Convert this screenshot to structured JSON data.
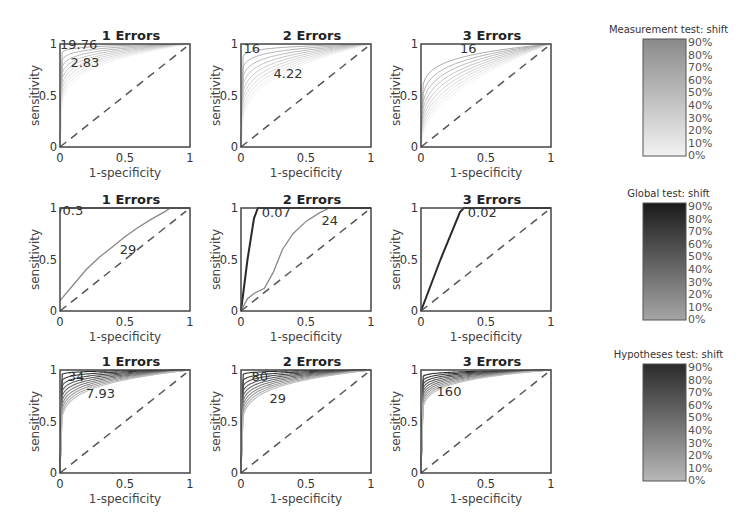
{
  "chart_data": [
    {
      "type": "line",
      "row": 0,
      "col": 0,
      "title": "1 Errors",
      "xlabel": "1-specificity",
      "ylabel": "sensitivity",
      "xlim": [
        0,
        1
      ],
      "ylim": [
        0,
        1
      ],
      "xticks": [
        "0",
        "0.5",
        "1"
      ],
      "yticks": [
        "0",
        "0.5",
        "1"
      ],
      "annotations": [
        {
          "text": "19.76",
          "x": 0.0,
          "y": 1.0
        },
        {
          "text": "2.83",
          "x": 0.08,
          "y": 0.83
        }
      ],
      "shade": "light",
      "curve_params": [
        0.02,
        0.04,
        0.06,
        0.08,
        0.1,
        0.12,
        0.14,
        0.16,
        0.18,
        0.2
      ],
      "diagonal": true
    },
    {
      "type": "line",
      "row": 0,
      "col": 1,
      "title": "2 Errors",
      "xlabel": "1-specificity",
      "ylabel": "sensitivity",
      "xlim": [
        0,
        1
      ],
      "ylim": [
        0,
        1
      ],
      "xticks": [
        "0",
        "0.5",
        "1"
      ],
      "yticks": [
        "0",
        "0.5",
        "1"
      ],
      "annotations": [
        {
          "text": "16",
          "x": 0.02,
          "y": 0.96
        },
        {
          "text": "4.22",
          "x": 0.25,
          "y": 0.72
        }
      ],
      "shade": "light",
      "curve_params": [
        0.03,
        0.06,
        0.09,
        0.12,
        0.15,
        0.18,
        0.21,
        0.24,
        0.27,
        0.3
      ],
      "diagonal": true
    },
    {
      "type": "line",
      "row": 0,
      "col": 2,
      "title": "3 Errors",
      "xlabel": "1-specificity",
      "ylabel": "sensitivity",
      "xlim": [
        0,
        1
      ],
      "ylim": [
        0,
        1
      ],
      "xticks": [
        "0",
        "0.5",
        "1"
      ],
      "yticks": [
        "0",
        "0.5",
        "1"
      ],
      "annotations": [
        {
          "text": "16",
          "x": 0.3,
          "y": 0.96
        }
      ],
      "shade": "light",
      "curve_params": [
        0.12,
        0.16,
        0.2,
        0.24,
        0.28,
        0.32,
        0.36,
        0.4,
        0.44,
        0.48
      ],
      "diagonal": true
    },
    {
      "type": "line",
      "row": 1,
      "col": 0,
      "title": "1 Errors",
      "xlabel": "1-specificity",
      "ylabel": "sensitivity",
      "xlim": [
        0,
        1
      ],
      "ylim": [
        0,
        1
      ],
      "xticks": [
        "0",
        "0.5",
        "1"
      ],
      "yticks": [
        "0",
        "0.5",
        "1"
      ],
      "annotations": [
        {
          "text": "0.3",
          "x": 0.02,
          "y": 0.98
        },
        {
          "text": "29",
          "x": 0.46,
          "y": 0.6
        }
      ],
      "series": [
        {
          "name": "top",
          "points": [
            [
              0,
              0.95
            ],
            [
              0.01,
              1
            ],
            [
              1,
              1
            ]
          ]
        },
        {
          "name": "main",
          "points": [
            [
              0,
              0.1
            ],
            [
              0.1,
              0.25
            ],
            [
              0.2,
              0.4
            ],
            [
              0.3,
              0.52
            ],
            [
              0.4,
              0.62
            ],
            [
              0.5,
              0.72
            ],
            [
              0.6,
              0.81
            ],
            [
              0.7,
              0.89
            ],
            [
              0.8,
              0.96
            ],
            [
              0.85,
              1
            ]
          ]
        }
      ],
      "shade": "mid",
      "diagonal": true
    },
    {
      "type": "line",
      "row": 1,
      "col": 1,
      "title": "2 Errors",
      "xlabel": "1-specificity",
      "ylabel": "sensitivity",
      "xlim": [
        0,
        1
      ],
      "ylim": [
        0,
        1
      ],
      "xticks": [
        "0",
        "0.5",
        "1"
      ],
      "yticks": [
        "0",
        "0.5",
        "1"
      ],
      "annotations": [
        {
          "text": "0.07",
          "x": 0.16,
          "y": 0.96
        },
        {
          "text": "24",
          "x": 0.62,
          "y": 0.88
        }
      ],
      "series": [
        {
          "name": "dark",
          "points": [
            [
              0,
              0
            ],
            [
              0.05,
              0.5
            ],
            [
              0.1,
              0.9
            ],
            [
              0.13,
              1
            ],
            [
              1,
              1
            ]
          ]
        },
        {
          "name": "light",
          "points": [
            [
              0,
              0
            ],
            [
              0.05,
              0.12
            ],
            [
              0.1,
              0.17
            ],
            [
              0.18,
              0.22
            ],
            [
              0.25,
              0.38
            ],
            [
              0.32,
              0.6
            ],
            [
              0.4,
              0.75
            ],
            [
              0.5,
              0.87
            ],
            [
              0.6,
              0.95
            ],
            [
              0.68,
              1
            ]
          ]
        }
      ],
      "shade": "dark",
      "diagonal": true
    },
    {
      "type": "line",
      "row": 1,
      "col": 2,
      "title": "3 Errors",
      "xlabel": "1-specificity",
      "ylabel": "sensitivity",
      "xlim": [
        0,
        1
      ],
      "ylim": [
        0,
        1
      ],
      "xticks": [
        "0",
        "0.5",
        "1"
      ],
      "yticks": [
        "0",
        "0.5",
        "1"
      ],
      "annotations": [
        {
          "text": "0.02",
          "x": 0.36,
          "y": 0.96
        }
      ],
      "series": [
        {
          "name": "dark",
          "points": [
            [
              0,
              0
            ],
            [
              0.15,
              0.5
            ],
            [
              0.3,
              0.96
            ],
            [
              0.33,
              1
            ],
            [
              1,
              1
            ]
          ]
        }
      ],
      "shade": "dark",
      "diagonal": true
    },
    {
      "type": "line",
      "row": 2,
      "col": 0,
      "title": "1 Errors",
      "xlabel": "1-specificity",
      "ylabel": "sensitivity",
      "xlim": [
        0,
        1
      ],
      "ylim": [
        0,
        1
      ],
      "xticks": [
        "0",
        "0.5",
        "1"
      ],
      "yticks": [
        "0",
        "0.5",
        "1"
      ],
      "annotations": [
        {
          "text": "34",
          "x": 0.06,
          "y": 0.94
        },
        {
          "text": "7.93",
          "x": 0.2,
          "y": 0.78
        }
      ],
      "shade": "dark",
      "curve_params": [
        0.01,
        0.025,
        0.04,
        0.055,
        0.07,
        0.085,
        0.1,
        0.115,
        0.13,
        0.145
      ],
      "diagonal": true
    },
    {
      "type": "line",
      "row": 2,
      "col": 1,
      "title": "2 Errors",
      "xlabel": "1-specificity",
      "ylabel": "sensitivity",
      "xlim": [
        0,
        1
      ],
      "ylim": [
        0,
        1
      ],
      "xticks": [
        "0",
        "0.5",
        "1"
      ],
      "yticks": [
        "0",
        "0.5",
        "1"
      ],
      "annotations": [
        {
          "text": "80",
          "x": 0.08,
          "y": 0.94
        },
        {
          "text": "29",
          "x": 0.22,
          "y": 0.73
        }
      ],
      "shade": "dark",
      "curve_params": [
        0.01,
        0.025,
        0.04,
        0.055,
        0.07,
        0.085,
        0.1,
        0.115,
        0.13,
        0.145
      ],
      "diagonal": true
    },
    {
      "type": "line",
      "row": 2,
      "col": 2,
      "title": "3 Errors",
      "xlabel": "1-specificity",
      "ylabel": "sensitivity",
      "xlim": [
        0,
        1
      ],
      "ylim": [
        0,
        1
      ],
      "xticks": [
        "0",
        "0.5",
        "1"
      ],
      "yticks": [
        "0",
        "0.5",
        "1"
      ],
      "annotations": [
        {
          "text": "160",
          "x": 0.12,
          "y": 0.8
        }
      ],
      "shade": "dark",
      "curve_params": [
        0.015,
        0.025,
        0.035,
        0.045,
        0.055,
        0.065,
        0.075,
        0.085,
        0.095,
        0.105
      ],
      "diagonal": true
    }
  ],
  "colorbars": [
    {
      "title": "Measurement test: shift",
      "ticks": [
        "90%",
        "80%",
        "70%",
        "60%",
        "50%",
        "40%",
        "30%",
        "20%",
        "10%",
        "0%"
      ],
      "top_color": "#8a8a8a",
      "bottom_color": "#f2f2f2"
    },
    {
      "title": "Global test: shift",
      "ticks": [
        "90%",
        "80%",
        "70%",
        "60%",
        "50%",
        "40%",
        "30%",
        "20%",
        "10%",
        "0%"
      ],
      "top_color": "#1a1a1a",
      "bottom_color": "#a6a6a6"
    },
    {
      "title": "Hypotheses test: shift",
      "ticks": [
        "90%",
        "80%",
        "70%",
        "60%",
        "50%",
        "40%",
        "30%",
        "20%",
        "10%",
        "0%"
      ],
      "top_color": "#2a2a2a",
      "bottom_color": "#b8b8b8"
    }
  ]
}
